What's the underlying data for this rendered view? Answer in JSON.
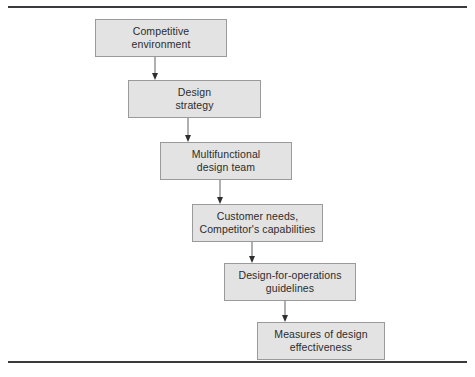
{
  "figure": {
    "type": "flowchart",
    "orientation": "top-down-cascading",
    "title": "",
    "border_rules": {
      "top_label": "top rule",
      "bottom_label": "bottom rule",
      "color": "#3a3a3c"
    },
    "style": {
      "node_fill": "#e3e3e3",
      "node_border": "#9a9a9a",
      "text_color": "#2c2c2c",
      "connector_color": "#6e6e70",
      "arrowhead_color": "#2f2f31"
    }
  },
  "nodes": [
    {
      "id": "competitive-environment",
      "label": "Competitive\nenvironment",
      "line1": "Competitive",
      "line2": "environment",
      "x": 95,
      "y": 19,
      "width": 132,
      "height": 38
    },
    {
      "id": "design-strategy",
      "label": "Design\nstrategy",
      "line1": "Design",
      "line2": "strategy",
      "x": 128,
      "y": 80,
      "width": 133,
      "height": 38
    },
    {
      "id": "multifunctional-design-team",
      "label": "Multifunctional\ndesign team",
      "line1": "Multifunctional",
      "line2": "design team",
      "x": 160,
      "y": 142,
      "width": 132,
      "height": 38
    },
    {
      "id": "customer-needs-competitor-capabilities",
      "label": "Customer needs,\nCompetitor's capabilities",
      "line1": "Customer needs,",
      "line2": "Competitor's capabilities",
      "x": 192,
      "y": 204,
      "width": 131,
      "height": 38
    },
    {
      "id": "design-for-operations-guidelines",
      "label": "Design-for-operations\nguidelines",
      "line1": "Design-for-operations",
      "line2": "guidelines",
      "x": 224,
      "y": 263,
      "width": 132,
      "height": 38
    },
    {
      "id": "measures-of-design-effectiveness",
      "label": "Measures of design\neffectiveness",
      "line1": "Measures of design",
      "line2": "effectiveness",
      "x": 257,
      "y": 322,
      "width": 128,
      "height": 38
    }
  ],
  "connectors": [
    {
      "id": "arrow-1",
      "from": "competitive-environment",
      "to": "design-strategy",
      "x": 155,
      "y1": 57,
      "y2": 80
    },
    {
      "id": "arrow-2",
      "from": "design-strategy",
      "to": "multifunctional-design-team",
      "x": 188,
      "y1": 118,
      "y2": 142
    },
    {
      "id": "arrow-3",
      "from": "multifunctional-design-team",
      "to": "customer-needs-competitor-capabilities",
      "x": 220,
      "y1": 180,
      "y2": 204
    },
    {
      "id": "arrow-4",
      "from": "customer-needs-competitor-capabilities",
      "to": "design-for-operations-guidelines",
      "x": 252,
      "y1": 242,
      "y2": 263
    },
    {
      "id": "arrow-5",
      "from": "design-for-operations-guidelines",
      "to": "measures-of-design-effectiveness",
      "x": 285,
      "y1": 301,
      "y2": 322
    }
  ]
}
